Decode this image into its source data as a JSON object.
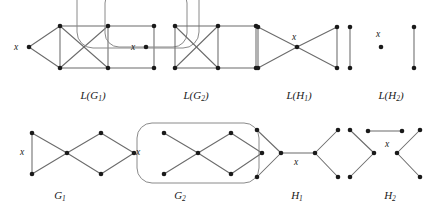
{
  "figure": {
    "background": "#ffffff",
    "edge_color": "#6b6b6b",
    "hull_color": "#8a8a8a",
    "node_color": "#1a1a1a",
    "vertex_label": "x"
  },
  "panels": [
    {
      "id": "LG1",
      "caption_base": "L(G",
      "caption_sub": "1",
      "caption_close": ")",
      "caption_text": "L(G1)",
      "caption_x": 93,
      "caption_y": 99,
      "x_label": "x",
      "x_label_pos": {
        "x": 14,
        "y": 50
      },
      "nodes": [
        {
          "name": "x",
          "x": 29,
          "y": 47
        },
        {
          "name": "a",
          "x": 60,
          "y": 26
        },
        {
          "name": "b",
          "x": 60,
          "y": 68
        },
        {
          "name": "c",
          "x": 108,
          "y": 26
        },
        {
          "name": "d",
          "x": 108,
          "y": 68
        },
        {
          "name": "e",
          "x": 154,
          "y": 26
        },
        {
          "name": "f",
          "x": 154,
          "y": 68
        }
      ],
      "edges": [
        [
          0,
          1
        ],
        [
          0,
          2
        ],
        [
          1,
          2
        ],
        [
          1,
          3
        ],
        [
          1,
          4
        ],
        [
          2,
          3
        ],
        [
          2,
          4
        ],
        [
          3,
          4
        ],
        [
          3,
          5
        ],
        [
          4,
          6
        ],
        [
          5,
          6
        ]
      ],
      "hulls": []
    },
    {
      "id": "LG2",
      "caption_base": "L(G",
      "caption_sub": "2",
      "caption_close": ")",
      "caption_text": "L(G2)",
      "caption_x": 196,
      "caption_y": 99,
      "x_label": "x",
      "x_label_pos": {
        "x": 131,
        "y": 50
      },
      "nodes": [
        {
          "name": "x",
          "x": 146,
          "y": 47
        },
        {
          "name": "a",
          "x": 175,
          "y": 26
        },
        {
          "name": "b",
          "x": 175,
          "y": 68
        },
        {
          "name": "c",
          "x": 218,
          "y": 26
        },
        {
          "name": "d",
          "x": 218,
          "y": 68
        },
        {
          "name": "e",
          "x": 256,
          "y": 26
        },
        {
          "name": "f",
          "x": 256,
          "y": 68
        }
      ],
      "edges": [
        [
          1,
          2
        ],
        [
          1,
          3
        ],
        [
          1,
          4
        ],
        [
          2,
          3
        ],
        [
          2,
          4
        ],
        [
          3,
          4
        ],
        [
          3,
          5
        ],
        [
          4,
          6
        ],
        [
          5,
          6
        ]
      ],
      "hulls": [
        {
          "name": "inner-loop",
          "x": 146,
          "y": 18,
          "w": 82,
          "h": 58,
          "r": 14
        },
        {
          "name": "outer-loop",
          "x": 138,
          "y": 10,
          "w": 122,
          "h": 76,
          "r": 16
        }
      ]
    },
    {
      "id": "LH1",
      "caption_base": "L(H",
      "caption_sub": "1",
      "caption_close": ")",
      "caption_text": "L(H1)",
      "caption_x": 299,
      "caption_y": 99,
      "x_label": "x",
      "x_label_pos": {
        "x": 292,
        "y": 40
      },
      "nodes": [
        {
          "name": "tl",
          "x": 258,
          "y": 27
        },
        {
          "name": "bl",
          "x": 258,
          "y": 68
        },
        {
          "name": "x",
          "x": 297,
          "y": 47
        },
        {
          "name": "tr",
          "x": 337,
          "y": 27
        },
        {
          "name": "br",
          "x": 337,
          "y": 68
        }
      ],
      "edges": [
        [
          0,
          1
        ],
        [
          0,
          2
        ],
        [
          1,
          2
        ],
        [
          2,
          3
        ],
        [
          2,
          4
        ],
        [
          3,
          4
        ]
      ],
      "hulls": []
    },
    {
      "id": "LH2",
      "caption_base": "L(H",
      "caption_sub": "2",
      "caption_close": ")",
      "caption_text": "L(H2)",
      "caption_x": 391,
      "caption_y": 99,
      "x_label": "x",
      "x_label_pos": {
        "x": 376,
        "y": 37
      },
      "nodes": [
        {
          "name": "l-top",
          "x": 350,
          "y": 27
        },
        {
          "name": "l-bot",
          "x": 350,
          "y": 68
        },
        {
          "name": "x",
          "x": 381,
          "y": 47
        },
        {
          "name": "r-top",
          "x": 414,
          "y": 27
        },
        {
          "name": "r-bot",
          "x": 414,
          "y": 68
        }
      ],
      "edges": [
        [
          0,
          1
        ],
        [
          3,
          4
        ]
      ],
      "hulls": []
    },
    {
      "id": "G1",
      "caption_base": "G",
      "caption_sub": "1",
      "caption_close": "",
      "caption_text": "G1",
      "caption_x": 60,
      "caption_y": 199,
      "x_label": "x",
      "x_label_pos": {
        "x": 20,
        "y": 155
      },
      "nodes": [
        {
          "name": "a",
          "x": 32,
          "y": 133
        },
        {
          "name": "b",
          "x": 32,
          "y": 174
        },
        {
          "name": "c",
          "x": 67,
          "y": 153
        },
        {
          "name": "d",
          "x": 101,
          "y": 133
        },
        {
          "name": "e",
          "x": 101,
          "y": 174
        },
        {
          "name": "f",
          "x": 134,
          "y": 153
        }
      ],
      "edges": [
        [
          0,
          1
        ],
        [
          0,
          2
        ],
        [
          1,
          2
        ],
        [
          2,
          3
        ],
        [
          2,
          4
        ],
        [
          3,
          5
        ],
        [
          4,
          5
        ]
      ],
      "hulls": []
    },
    {
      "id": "G2",
      "caption_base": "G",
      "caption_sub": "2",
      "caption_close": "",
      "caption_text": "G2",
      "caption_x": 180,
      "caption_y": 199,
      "x_label": "x",
      "x_label_pos": {
        "x": 136,
        "y": 155
      },
      "nodes": [
        {
          "name": "a",
          "x": 164,
          "y": 133
        },
        {
          "name": "b",
          "x": 164,
          "y": 174
        },
        {
          "name": "c",
          "x": 198,
          "y": 153
        },
        {
          "name": "d",
          "x": 231,
          "y": 133
        },
        {
          "name": "e",
          "x": 231,
          "y": 174
        },
        {
          "name": "f",
          "x": 262,
          "y": 153
        }
      ],
      "edges": [
        [
          0,
          2
        ],
        [
          1,
          2
        ],
        [
          2,
          3
        ],
        [
          2,
          4
        ],
        [
          3,
          5
        ],
        [
          4,
          5
        ]
      ],
      "hulls": [
        {
          "name": "x-edge-loop",
          "x": 198,
          "y": 153,
          "w": 122,
          "h": 60,
          "r": 15
        }
      ]
    },
    {
      "id": "H1",
      "caption_base": "H",
      "caption_sub": "1",
      "caption_close": "",
      "caption_text": "H1",
      "caption_x": 297,
      "caption_y": 199,
      "x_label": "x",
      "x_label_pos": {
        "x": 294,
        "y": 165
      },
      "nodes": [
        {
          "name": "tl",
          "x": 257,
          "y": 130
        },
        {
          "name": "bl",
          "x": 257,
          "y": 177
        },
        {
          "name": "cl",
          "x": 281,
          "y": 153
        },
        {
          "name": "cr",
          "x": 315,
          "y": 153
        },
        {
          "name": "tr",
          "x": 338,
          "y": 130
        },
        {
          "name": "br",
          "x": 338,
          "y": 177
        }
      ],
      "edges": [
        [
          0,
          2
        ],
        [
          1,
          2
        ],
        [
          2,
          3
        ],
        [
          3,
          4
        ],
        [
          3,
          5
        ]
      ],
      "hulls": []
    },
    {
      "id": "H2",
      "caption_base": "H",
      "caption_sub": "2",
      "caption_close": "",
      "caption_text": "H2",
      "caption_x": 390,
      "caption_y": 199,
      "x_label": "x",
      "x_label_pos": {
        "x": 385,
        "y": 147
      },
      "nodes": [
        {
          "name": "tl",
          "x": 350,
          "y": 130
        },
        {
          "name": "bl",
          "x": 350,
          "y": 177
        },
        {
          "name": "cl",
          "x": 374,
          "y": 153
        },
        {
          "name": "xl",
          "x": 368,
          "y": 131
        },
        {
          "name": "xr",
          "x": 402,
          "y": 131
        },
        {
          "name": "cr",
          "x": 397,
          "y": 153
        },
        {
          "name": "tr",
          "x": 420,
          "y": 130
        },
        {
          "name": "br",
          "x": 420,
          "y": 177
        }
      ],
      "edges": [
        [
          0,
          2
        ],
        [
          1,
          2
        ],
        [
          3,
          4
        ],
        [
          5,
          6
        ],
        [
          5,
          7
        ]
      ],
      "hulls": []
    }
  ]
}
